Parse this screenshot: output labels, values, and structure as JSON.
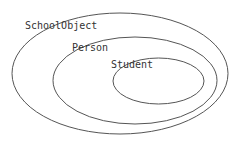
{
  "diagram": {
    "type": "nested-sets",
    "colors": {
      "background": "#ffffff",
      "stroke": "#555555",
      "text": "#333333"
    },
    "sets": [
      {
        "label": "SchoolObject",
        "ellipse": {
          "cx": 120,
          "cy": 73.5,
          "rx": 108,
          "ry": 60.5
        },
        "label_pos": {
          "x": 25,
          "y": 29
        }
      },
      {
        "label": "Person",
        "ellipse": {
          "cx": 135,
          "cy": 80.5,
          "rx": 82,
          "ry": 43.5
        },
        "label_pos": {
          "x": 72,
          "y": 51
        }
      },
      {
        "label": "Student",
        "ellipse": {
          "cx": 158.5,
          "cy": 81,
          "rx": 45.5,
          "ry": 23
        },
        "label_pos": {
          "x": 111,
          "y": 68
        }
      }
    ]
  }
}
